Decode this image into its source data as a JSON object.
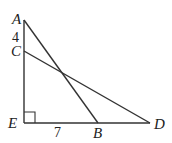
{
  "diagram": {
    "points": {
      "A": {
        "label": "A",
        "x": 24,
        "y": 20
      },
      "C": {
        "label": "C",
        "x": 24,
        "y": 51
      },
      "E": {
        "label": "E",
        "x": 24,
        "y": 123
      },
      "B": {
        "label": "B",
        "x": 98,
        "y": 123
      },
      "D": {
        "label": "D",
        "x": 150,
        "y": 123
      }
    },
    "segments": [
      "AE",
      "ED",
      "AB",
      "CD"
    ],
    "right_angle_at": "E",
    "measures": {
      "AC": "4",
      "EB": "7"
    },
    "stroke_color": "#333333"
  }
}
